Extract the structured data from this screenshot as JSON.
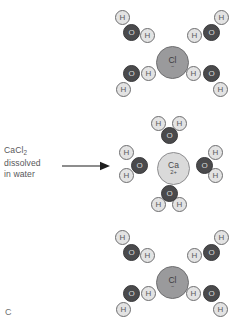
{
  "figure": {
    "panel_letter": "C",
    "caption": {
      "line1_formula": "CaCl",
      "line1_subscript": "2",
      "line2": "dissolved",
      "line3": "in water"
    },
    "arrow": {
      "direction": "right",
      "name": "reaction-arrow"
    },
    "colors": {
      "background": "#ffffff",
      "hydrogen": "#e3e3e3",
      "hydrogen_outline": "#6e6e70",
      "oxygen": "#4a4a4c",
      "chloride": "#9a9a9c",
      "calcium": "#dadada",
      "text": "#58585a"
    },
    "labels": {
      "hydrogen": "H",
      "oxygen": "O",
      "chloride": "Cl",
      "chloride_charge": "−",
      "calcium": "Ca",
      "calcium_charge": "2+"
    },
    "clusters": [
      {
        "name": "hydrated-chloride-top",
        "ion": "Cl",
        "ion_charge": "−",
        "water_count": 4,
        "description": "Chloride ion solvated by four water molecules with hydrogen atoms oriented toward the anion"
      },
      {
        "name": "hydrated-calcium",
        "ion": "Ca",
        "ion_charge": "2+",
        "water_count": 4,
        "description": "Calcium ion solvated by four water molecules with oxygen atoms oriented toward the cation"
      },
      {
        "name": "hydrated-chloride-bottom",
        "ion": "Cl",
        "ion_charge": "−",
        "water_count": 4,
        "description": "Chloride ion solvated by four water molecules with hydrogen atoms oriented toward the anion"
      }
    ]
  }
}
